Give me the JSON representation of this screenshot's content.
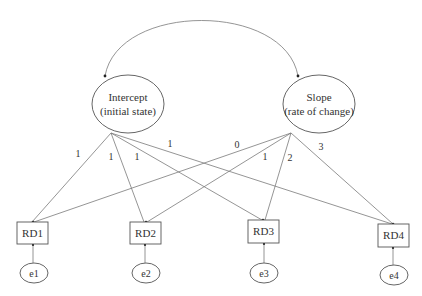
{
  "diagram": {
    "type": "latent growth curve model",
    "latent_factors": [
      {
        "id": "intercept",
        "line1": "Intercept",
        "line2": "(initial state)"
      },
      {
        "id": "slope",
        "line1": "Slope",
        "line2": "(rate of change)"
      }
    ],
    "covariance": {
      "from": "intercept",
      "to": "slope"
    },
    "observed": [
      {
        "id": "RD1",
        "label": "RD1"
      },
      {
        "id": "RD2",
        "label": "RD2"
      },
      {
        "id": "RD3",
        "label": "RD3"
      },
      {
        "id": "RD4",
        "label": "RD4"
      }
    ],
    "errors": [
      {
        "id": "e1",
        "label": "e1",
        "target": "RD1"
      },
      {
        "id": "e2",
        "label": "e2",
        "target": "RD2"
      },
      {
        "id": "e3",
        "label": "e3",
        "target": "RD3"
      },
      {
        "id": "e4",
        "label": "e4",
        "target": "RD4"
      }
    ],
    "loadings": {
      "intercept": [
        "1",
        "1",
        "1",
        "1"
      ],
      "slope": [
        "0",
        "1",
        "2",
        "3"
      ]
    }
  }
}
